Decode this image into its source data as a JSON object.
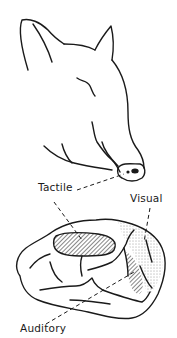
{
  "figure": {
    "subjects": [
      "pig-head",
      "brain-cortex"
    ],
    "labels": {
      "tactile": "Tactile",
      "visual": "Visual",
      "auditory": "Auditory"
    },
    "colors": {
      "line": "#1a1a1a",
      "background": "#ffffff"
    }
  }
}
